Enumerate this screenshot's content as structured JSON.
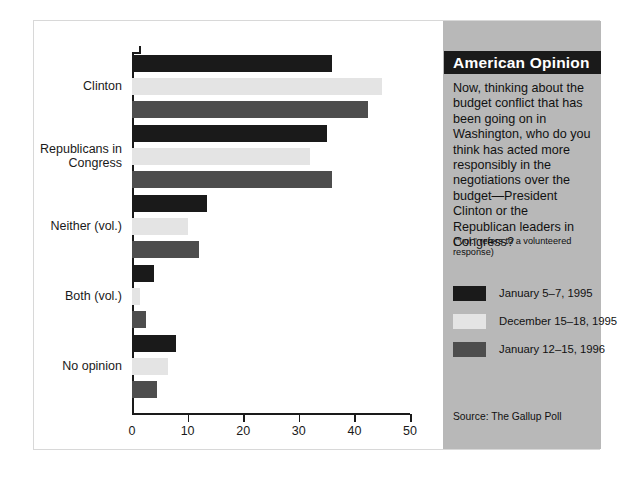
{
  "sidebar": {
    "title": "American Opinion",
    "question": "Now, thinking about the budget conflict that has been going on in Washington, who do you think has acted more responsibly in the negotiations over the budget—President Clinton or the Republican leaders in Congress?",
    "note": "(\"vol.\" refers to a volunteered response)",
    "source": "Source: The Gallup Poll"
  },
  "chart_data": {
    "type": "bar",
    "orientation": "horizontal",
    "title": "American Opinion",
    "xlabel": "",
    "ylabel": "",
    "xlim": [
      0,
      50
    ],
    "xticks": [
      0,
      10,
      20,
      30,
      40,
      50
    ],
    "xtick_labels": [
      "0",
      "10",
      "20",
      "30",
      "40",
      "50"
    ],
    "grid": false,
    "legend_position": "right-panel",
    "categories": [
      "Clinton",
      "Republicans in\nCongress",
      "Neither (vol.)",
      "Both (vol.)",
      "No opinion"
    ],
    "series": [
      {
        "name": "January 5–7, 1995",
        "color": "#1a1a1a",
        "values": [
          36,
          35,
          13.5,
          4,
          8
        ]
      },
      {
        "name": "December 15–18, 1995",
        "color": "#e4e4e4",
        "values": [
          45,
          32,
          10,
          1.5,
          6.5
        ]
      },
      {
        "name": "January 12–15, 1996",
        "color": "#4d4d4d",
        "values": [
          42.5,
          36,
          12,
          2.5,
          4.5
        ]
      }
    ],
    "source": "Source: The Gallup Poll"
  }
}
